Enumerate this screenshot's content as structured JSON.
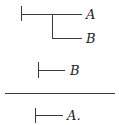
{
  "diagram": {
    "type": "inference-rule",
    "premises": [
      {
        "judgment": "A conditional on B",
        "labels": {
          "upper": "A",
          "lower": "B"
        }
      },
      {
        "judgment": "B",
        "labels": {
          "main": "B"
        }
      }
    ],
    "conclusion": {
      "judgment": "A",
      "labels": {
        "main": "A."
      }
    }
  }
}
